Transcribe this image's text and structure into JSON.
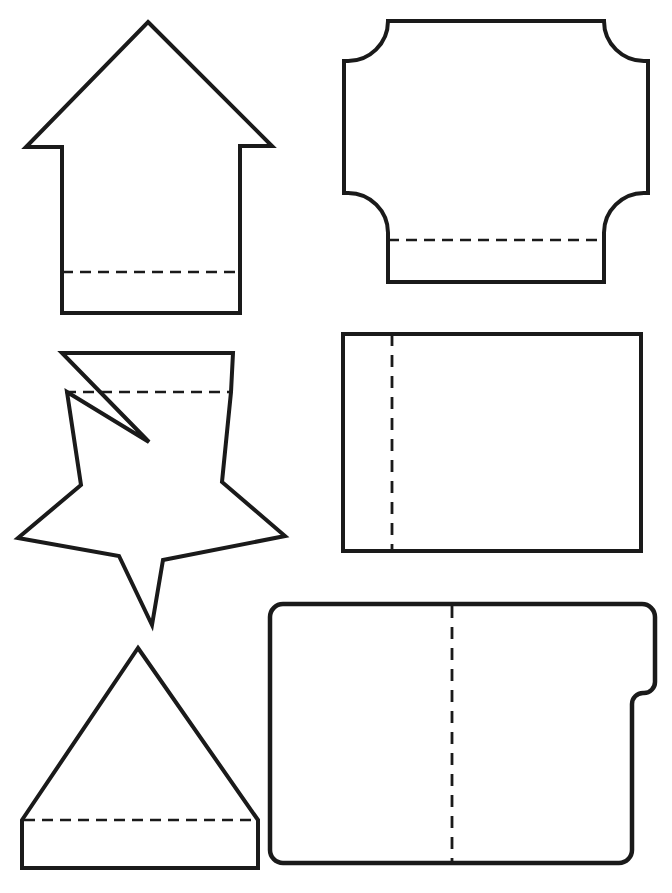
{
  "page": {
    "width": 672,
    "height": 893,
    "background_color": "#ffffff",
    "ink_color": "#1a1a1a"
  },
  "style": {
    "outline_stroke_color": "#1a1a1a",
    "outline_stroke_width": 4,
    "fold_stroke_color": "#1a1a1a",
    "fold_stroke_width": 2.6,
    "fold_dash_pattern": "11 7",
    "fill_color": "#ffffff"
  },
  "shapes": [
    {
      "id": "arrow-up",
      "name": "Up Arrow Template",
      "column": "left",
      "row": 1,
      "fold_line": {
        "orientation": "horizontal",
        "y": 272,
        "x1": 62,
        "x2": 238
      },
      "outline_points": "148,22 272,146 240,146 240,313 62,313 62,147 26,147",
      "bounds": {
        "x": 24,
        "y": 20,
        "width": 250,
        "height": 295
      }
    },
    {
      "id": "concave-corner-rectangle",
      "name": "Concave Corner Rectangle Template",
      "column": "right",
      "row": 1,
      "fold_line": {
        "orientation": "horizontal",
        "y": 240,
        "x1": 388,
        "x2": 604
      },
      "corner_radius": 40,
      "bounds": {
        "x": 342,
        "y": 20,
        "width": 308,
        "height": 264
      }
    },
    {
      "id": "star-with-tab",
      "name": "Five Point Star With Tab Template",
      "column": "left",
      "row": 2,
      "fold_line": {
        "orientation": "horizontal",
        "y": 392,
        "x1": 64,
        "x2": 232
      },
      "outline_points": "62,353 233,353 231,392 222,482 285,536 163,560 152,625 119,556 18,538 81,485 67,392",
      "tab": {
        "top_y": 353,
        "left_x": 62,
        "right_x": 233,
        "notch_apex_x": 149,
        "notch_apex_y": 442
      },
      "bounds": {
        "x": 16,
        "y": 350,
        "width": 272,
        "height": 278
      }
    },
    {
      "id": "plain-rectangle",
      "name": "Plain Rectangle Template",
      "column": "right",
      "row": 2,
      "fold_line": {
        "orientation": "vertical",
        "x": 392,
        "y1": 334,
        "y2": 551
      },
      "bounds": {
        "x": 343,
        "y": 334,
        "width": 298,
        "height": 217
      }
    },
    {
      "id": "triangle-with-flap",
      "name": "Triangle With Flap Template",
      "column": "left",
      "row": 3,
      "fold_line": {
        "orientation": "horizontal",
        "y": 820,
        "x1": 22,
        "x2": 258
      },
      "outline_points": "138,648 258,820 258,868 22,868 22,820",
      "bounds": {
        "x": 20,
        "y": 646,
        "width": 240,
        "height": 224
      }
    },
    {
      "id": "notched-rounded-rectangle",
      "name": "Notched Rounded Rectangle Template",
      "column": "right",
      "row": 3,
      "fold_line": {
        "orientation": "vertical",
        "x": 452,
        "y1": 606,
        "y2": 863
      },
      "corner_radius": 13,
      "notch": {
        "side": "right",
        "upper_x": 655,
        "lower_x": 632,
        "start_y": 692,
        "end_y": 718
      },
      "bounds": {
        "x": 270,
        "y": 604,
        "width": 387,
        "height": 261
      }
    }
  ]
}
